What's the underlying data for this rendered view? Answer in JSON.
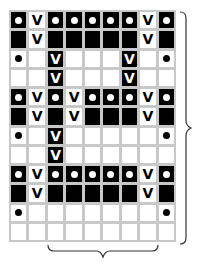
{
  "chart_data": {
    "type": "table",
    "title": "",
    "columns": 9,
    "rows": 12,
    "legend": {
      "O": "black cell with white dot",
      "B": "black cell",
      "V": "white cell with V",
      "BV": "black cell with white V",
      "D": "white cell with black dot",
      "E": "empty white cell"
    },
    "grid": [
      [
        "O",
        "V",
        "O",
        "O",
        "O",
        "O",
        "O",
        "V",
        "O"
      ],
      [
        "B",
        "V",
        "B",
        "B",
        "B",
        "B",
        "B",
        "V",
        "B"
      ],
      [
        "D",
        "E",
        "BV",
        "E",
        "E",
        "E",
        "BV",
        "E",
        "D"
      ],
      [
        "E",
        "E",
        "BV",
        "E",
        "E",
        "E",
        "BV",
        "E",
        "E"
      ],
      [
        "O",
        "V",
        "O",
        "V",
        "O",
        "O",
        "O",
        "V",
        "O"
      ],
      [
        "B",
        "V",
        "B",
        "V",
        "B",
        "B",
        "B",
        "V",
        "B"
      ],
      [
        "D",
        "E",
        "BV",
        "E",
        "E",
        "E",
        "E",
        "E",
        "D"
      ],
      [
        "E",
        "E",
        "BV",
        "E",
        "E",
        "E",
        "E",
        "E",
        "E"
      ],
      [
        "O",
        "V",
        "O",
        "O",
        "O",
        "O",
        "O",
        "V",
        "O"
      ],
      [
        "B",
        "V",
        "B",
        "B",
        "B",
        "B",
        "B",
        "V",
        "B"
      ],
      [
        "D",
        "E",
        "E",
        "E",
        "E",
        "E",
        "E",
        "E",
        "D"
      ],
      [
        "E",
        "E",
        "E",
        "E",
        "E",
        "E",
        "E",
        "E",
        "E"
      ]
    ],
    "annotations": [
      "right brace spanning rows 1-12",
      "bottom brace spanning columns 3-8"
    ]
  },
  "glyphs": {
    "v": "V"
  },
  "colors": {
    "black": "#000000",
    "white": "#ffffff",
    "gridline": "#c8c8c8",
    "brace": "#333333"
  }
}
